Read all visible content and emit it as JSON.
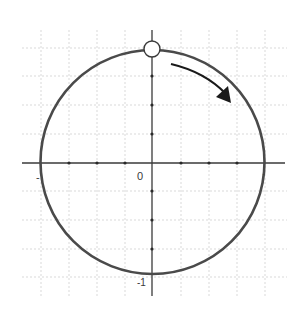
{
  "diagram": {
    "type": "unit-circle",
    "colors": {
      "circle": "#4a4a4a",
      "axis": "#3a3a3a",
      "grid": "#c8c8c8",
      "arrow": "#1a1a1a",
      "marker_fill": "#ffffff"
    },
    "labels": {
      "left_x": "-",
      "origin": "0",
      "bottom_y": "-1",
      "right_x": "·"
    },
    "marker": {
      "position": "top",
      "style": "open-circle"
    },
    "arrow": {
      "direction": "clockwise"
    }
  }
}
